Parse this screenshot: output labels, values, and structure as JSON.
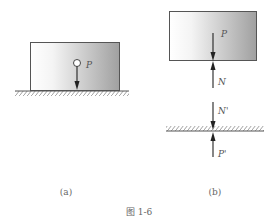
{
  "figure": {
    "caption": "图 1-6",
    "panel_a": {
      "label": "(a)",
      "force_labels": {
        "weight": "P"
      }
    },
    "panel_b": {
      "label": "(b)",
      "force_labels": {
        "weight": "P",
        "normal": "N",
        "normal_reaction": "N'",
        "weight_reaction": "P'"
      }
    },
    "colors": {
      "outline": "#555555",
      "box_gradient_start": "#ffffff",
      "box_gradient_end": "#9a9a9a",
      "arrow": "#222222",
      "label": "#555555"
    }
  }
}
